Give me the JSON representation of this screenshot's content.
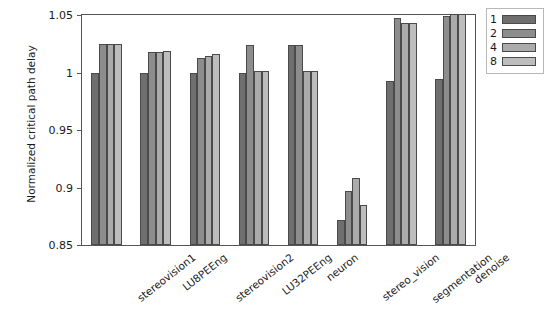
{
  "chart_data": {
    "type": "bar",
    "title": "",
    "xlabel": "",
    "ylabel": "Normalized critical path delay",
    "ylim": [
      0.85,
      1.05
    ],
    "yticks": [
      0.85,
      0.9,
      0.95,
      1,
      1.05
    ],
    "ytick_labels": [
      "0.85",
      "0.9",
      "0.95",
      "1",
      "1.05"
    ],
    "grid": false,
    "legend_position": "upper right outside",
    "legend_title": "",
    "categories": [
      "stereovision1",
      "LU8PEEng",
      "stereovision2",
      "LU32PEEng",
      "neuron",
      "stereo_vision",
      "segmentation",
      "denoise"
    ],
    "series": [
      {
        "name": "1",
        "color": "#6f6f6f",
        "values": [
          1.0,
          1.0,
          1.0,
          1.0,
          1.024,
          0.872,
          0.993,
          0.994
        ]
      },
      {
        "name": "2",
        "color": "#8d8d8d",
        "values": [
          1.025,
          1.018,
          1.013,
          1.024,
          1.024,
          0.897,
          1.047,
          1.049
        ]
      },
      {
        "name": "4",
        "color": "#ababab",
        "values": [
          1.025,
          1.018,
          1.014,
          1.001,
          1.001,
          0.908,
          1.043,
          1.051
        ]
      },
      {
        "name": "8",
        "color": "#bdbdbd",
        "values": [
          1.025,
          1.019,
          1.016,
          1.001,
          1.001,
          0.885,
          1.043,
          1.051
        ]
      }
    ]
  },
  "legend": {
    "items": [
      {
        "label": "1",
        "color": "#6f6f6f"
      },
      {
        "label": "2",
        "color": "#8d8d8d"
      },
      {
        "label": "4",
        "color": "#ababab"
      },
      {
        "label": "8",
        "color": "#bdbdbd"
      }
    ]
  }
}
